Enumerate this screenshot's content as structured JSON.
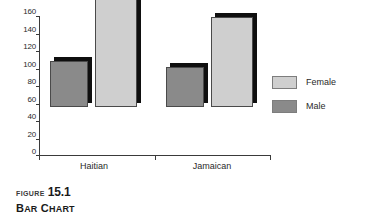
{
  "chart_data": {
    "type": "bar",
    "categories": [
      "Haitian",
      "Jamaican"
    ],
    "series": [
      {
        "name": "Female",
        "values": [
          152,
          103
        ],
        "color": "#cfcfcf"
      },
      {
        "name": "Male",
        "values": [
          53,
          46
        ],
        "color": "#8a8a8a"
      }
    ],
    "xlabel": "",
    "ylabel": "",
    "ylim": [
      0,
      160
    ],
    "y_ticks": [
      0,
      20,
      40,
      60,
      80,
      100,
      120,
      140,
      160
    ],
    "y_tick_labels": [
      "0",
      "20",
      "40",
      "60",
      "80",
      "100",
      "120",
      "140",
      "160"
    ],
    "grid": false,
    "legend_position": "right",
    "bar_style": "3d-shadow"
  },
  "legend": {
    "items": [
      {
        "label": "Female",
        "color": "#cfcfcf"
      },
      {
        "label": "Male",
        "color": "#8a8a8a"
      }
    ]
  },
  "axis": {
    "y_tick_labels": [
      "160",
      "140",
      "120",
      "100",
      "80",
      "60",
      "40",
      "20",
      "0"
    ],
    "x_categories": [
      "Haitian",
      "Jamaican"
    ]
  },
  "caption": {
    "figure_word": "FIGURE",
    "figure_number": "15.1",
    "title_lead": "B",
    "title_lead_rest": "AR",
    "title_second": "C",
    "title_second_rest": "HART",
    "title_full": "Bar Chart"
  },
  "colors": {
    "female_fill": "#cfcfcf",
    "male_fill": "#8a8a8a",
    "shadow": "#0f0f0f",
    "axis": "#3a3a3a",
    "text": "#2a2a2a",
    "background": "#ffffff"
  }
}
